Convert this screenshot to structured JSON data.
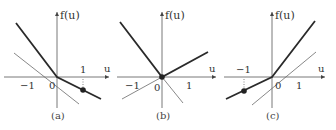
{
  "panels": [
    {
      "caption": "(a)",
      "y_axis_label": "f(u)",
      "x_axis_label": "u",
      "tick_labels": {
        "neg_one": "−1",
        "zero": "0",
        "pos_one": "1"
      },
      "description": "Thick piecewise line with slopes: steep negative for u<0, shallow negative for u>0; marked point at u=1; thin reference line through origin"
    },
    {
      "caption": "(b)",
      "y_axis_label": "f(u)",
      "x_axis_label": "u",
      "tick_labels": {
        "neg_one": "−1",
        "zero": "0",
        "pos_one": "1"
      },
      "description": "Thick V-shaped piecewise line with kink at origin (marked point at u=0); thin lines extending the branches"
    },
    {
      "caption": "(c)",
      "y_axis_label": "f(u)",
      "x_axis_label": "u",
      "tick_labels": {
        "neg_one": "−1",
        "zero": "0",
        "pos_one": "1"
      },
      "description": "Thick piecewise line: shallow positive slope for u<0, steep positive slope for u>0; marked point at u=-1; thin reference line through origin"
    }
  ],
  "colors": {
    "thick_line": "#2a2a2a",
    "thin_line": "#6a6a6a",
    "axis": "#555555"
  }
}
